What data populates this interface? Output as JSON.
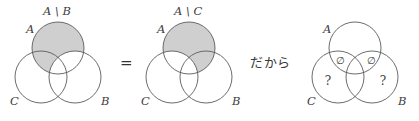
{
  "figure": {
    "kind": "set-theory-venn-identity",
    "background_color": "#ffffff",
    "stroke_color": "#5b5b5b",
    "shade_color": "#cfcfcf",
    "text_color": "#3d3d3d"
  },
  "operators": {
    "equals": "=",
    "connective": "だから"
  },
  "panels": [
    {
      "id": "panel-1",
      "caption": "A \\ B",
      "set_labels": {
        "top": "A",
        "left": "C",
        "right": "B"
      },
      "shaded_region": "A minus B",
      "markers": []
    },
    {
      "id": "panel-2",
      "caption": "A \\ C",
      "set_labels": {
        "top": "A",
        "left": "C",
        "right": "B"
      },
      "shaded_region": "A minus C",
      "markers": []
    },
    {
      "id": "panel-3",
      "caption": "",
      "set_labels": {
        "top": "A",
        "left": "C",
        "right": "B"
      },
      "shaded_region": "none",
      "markers": [
        {
          "symbol": "∅",
          "region": "A-and-C-only"
        },
        {
          "symbol": "∅",
          "region": "A-and-B-only"
        },
        {
          "symbol": "?",
          "region": "C-only"
        },
        {
          "symbol": "?",
          "region": "B-only"
        }
      ]
    }
  ]
}
